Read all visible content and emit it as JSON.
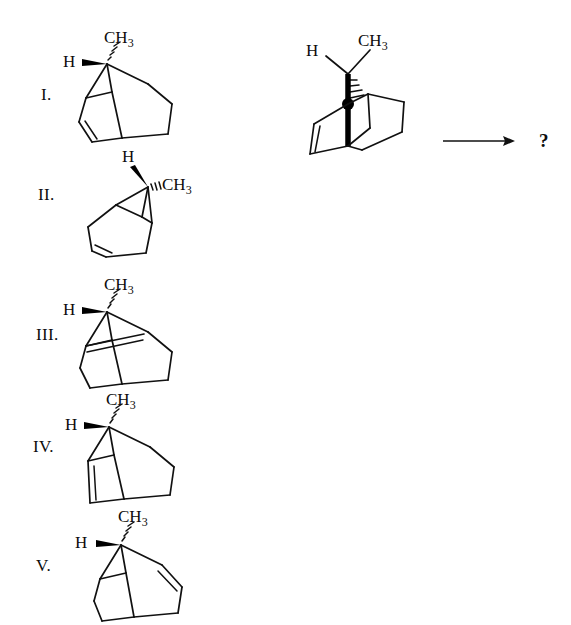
{
  "page": {
    "background_color": "#ffffff",
    "ink_color": "#111111",
    "width": 571,
    "height": 625
  },
  "question": {
    "prompt_symbol": "?",
    "arrow": "reaction-arrow-right"
  },
  "reactant": {
    "name": "bicyclo[2.2.2]oct-2-ene-methyl",
    "labels": {
      "hydrogen": "H",
      "methyl_c": "CH",
      "methyl_sub": "3"
    },
    "features": {
      "bold_bridgehead_bond": true,
      "stereocenter_dot": true,
      "hash_bond": true,
      "double_bond_position": "left-edge"
    }
  },
  "options": [
    {
      "id": "I",
      "label": "I.",
      "labels": {
        "hydrogen": "H",
        "methyl_c": "CH",
        "methyl_sub": "3"
      },
      "h_bond_style": "bold-wedge",
      "methyl_bond_style": "hashed-wedge",
      "double_bond_position": "lower-left"
    },
    {
      "id": "II",
      "label": "II.",
      "labels": {
        "hydrogen": "H",
        "methyl_c": "CH",
        "methyl_sub": "3"
      },
      "h_bond_style": "bold-wedge",
      "methyl_bond_style": "hashed-wedge",
      "double_bond_position": "lower-left",
      "mirrored": true
    },
    {
      "id": "III",
      "label": "III.",
      "labels": {
        "hydrogen": "H",
        "methyl_c": "CH",
        "methyl_sub": "3"
      },
      "h_bond_style": "bold-wedge",
      "methyl_bond_style": "hashed-wedge",
      "double_bond_position": "upper-interior"
    },
    {
      "id": "IV",
      "label": "IV.",
      "labels": {
        "hydrogen": "H",
        "methyl_c": "CH",
        "methyl_sub": "3"
      },
      "h_bond_style": "bold-wedge",
      "methyl_bond_style": "hashed-wedge",
      "double_bond_position": "left-edge"
    },
    {
      "id": "V",
      "label": "V.",
      "labels": {
        "hydrogen": "H",
        "methyl_c": "CH",
        "methyl_sub": "3"
      },
      "h_bond_style": "bold-wedge",
      "methyl_bond_style": "hashed-wedge",
      "double_bond_position": "right-edge"
    }
  ]
}
